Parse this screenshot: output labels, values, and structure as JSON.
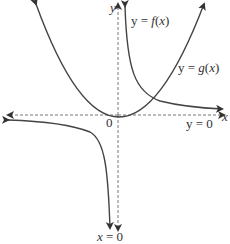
{
  "figure": {
    "type": "function graph",
    "axes": {
      "x_label": "x",
      "y_label": "y",
      "origin_label": "0",
      "x_axis_style": "dashed with arrows",
      "y_axis_style": "dashed with arrows"
    },
    "curves": [
      {
        "name": "f",
        "label": "y = f(x)",
        "description": "reciprocal-type curve with branches in quadrants I and III"
      },
      {
        "name": "g",
        "label": "y = g(x)",
        "description": "parabola with vertex at origin"
      }
    ],
    "asymptotes": [
      {
        "label": "y = 0",
        "orientation": "horizontal"
      },
      {
        "label": "x = 0",
        "orientation": "vertical"
      }
    ],
    "colors": {
      "curve": "#444444",
      "axis": "#777777",
      "text": "#333333"
    }
  }
}
